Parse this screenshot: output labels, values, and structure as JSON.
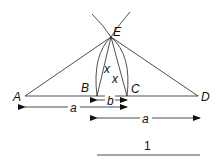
{
  "diagram": {
    "points": {
      "A": "A",
      "B": "B",
      "C": "C",
      "D": "D",
      "E": "E"
    },
    "angle_labels": [
      "x",
      "x"
    ],
    "segment_labels": {
      "AC": "a",
      "BC": "b",
      "BD": "a"
    },
    "scale_label": "1"
  }
}
